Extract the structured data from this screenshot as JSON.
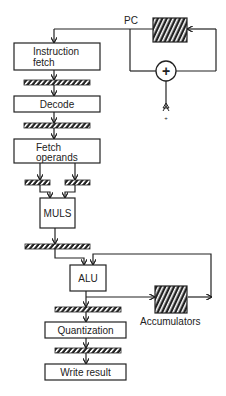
{
  "diagram": {
    "type": "pipeline-block-diagram",
    "colors": {
      "line": "#222222",
      "background": "#ffffff",
      "hatch": "#222222"
    },
    "program_counter": {
      "label": "PC"
    },
    "adder": {
      "symbol": "+",
      "input_label": "+"
    },
    "stages": [
      {
        "id": "instruction-fetch",
        "line1": "Instruction",
        "line2": "fetch"
      },
      {
        "id": "decode",
        "label": "Decode"
      },
      {
        "id": "fetch-operands",
        "line1": "Fetch",
        "line2": "operands"
      },
      {
        "id": "muls",
        "label": "MULS"
      },
      {
        "id": "alu",
        "label": "ALU"
      },
      {
        "id": "quantization",
        "label": "Quantization"
      },
      {
        "id": "write-result",
        "label": "Write result"
      }
    ],
    "accumulators": {
      "label": "Accumulators"
    }
  }
}
